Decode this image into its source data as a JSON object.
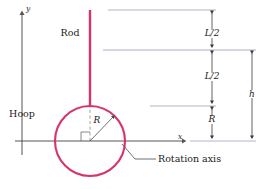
{
  "figure": {
    "colors": {
      "object": "#d6336c",
      "axis": "#555555",
      "dimension": "#3a3a3a",
      "reference_line": "#9aa0b5",
      "guide_dashed": "#8a8a8a",
      "text": "#1a1a1a",
      "background": "#ffffff"
    },
    "labels": {
      "rod": "Rod",
      "hoop": "Hoop",
      "radius": "R",
      "rotation_axis": "Rotation axis",
      "y_axis": "y",
      "x_axis": "x"
    },
    "dimensions": [
      {
        "id": "upper-half-rod",
        "label": "L/2",
        "from_y": 10,
        "to_y": 50
      },
      {
        "id": "lower-half-rod",
        "label": "L/2",
        "from_y": 50,
        "to_y": 106
      },
      {
        "id": "hoop-radius",
        "label": "R",
        "from_y": 106,
        "to_y": 141
      },
      {
        "id": "total-height",
        "label": "h",
        "from_y": 50,
        "to_y": 141
      }
    ],
    "geometry": {
      "hoop_center_x": 90,
      "hoop_center_y": 141,
      "hoop_radius": 35,
      "rod_x": 90,
      "rod_top_y": 10,
      "rod_bottom_y": 106,
      "y_axis_x": 22,
      "x_axis_y": 141,
      "dimension_column_x": 212,
      "h_column_x": 252
    }
  }
}
